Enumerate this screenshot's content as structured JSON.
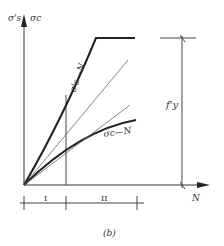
{
  "figure": {
    "caption": "(b)",
    "y_axis_label_left": "σ's",
    "y_axis_label_right": "σc",
    "x_axis_label": "N",
    "curve_steel_label": "σ's—N",
    "curve_concrete_label": "σc—N",
    "yield_label": "f'y",
    "stage_labels": [
      "I",
      "II"
    ]
  },
  "colors": {
    "line": "#222222",
    "thin_line": "#555555",
    "text": "#333333"
  }
}
